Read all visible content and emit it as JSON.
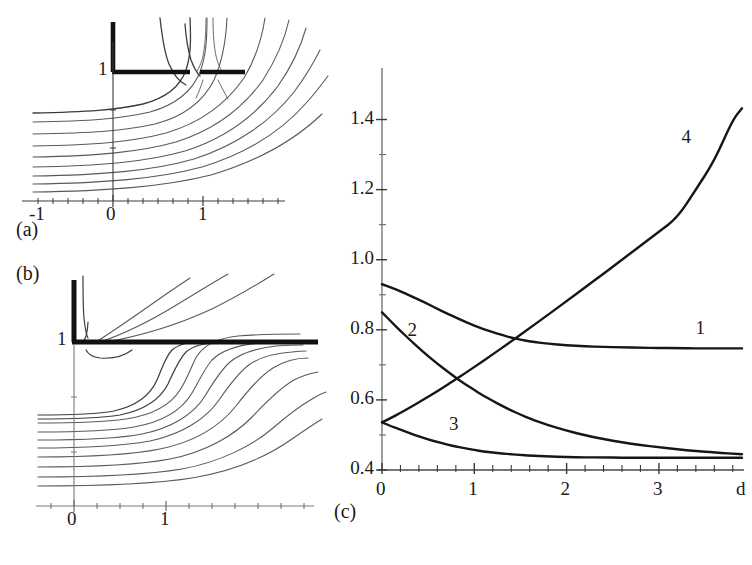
{
  "figure": {
    "type": "multi-panel-scientific-figure",
    "background_color": "#ffffff",
    "ink_color": "#1a1a1a",
    "stream_color": "#4a4a4a"
  },
  "panels": [
    {
      "id": "a",
      "label": "(a)",
      "kind": "streamline-contour-plot",
      "x_ticks": [
        "-1",
        "0",
        "1"
      ],
      "y_ticks": [
        "1"
      ],
      "obstacle": "L-shaped thick barrier plus detached horizontal plate"
    },
    {
      "id": "b",
      "label": "(b)",
      "kind": "streamline-contour-plot",
      "x_ticks": [
        "0",
        "1"
      ],
      "y_ticks": [
        "1"
      ],
      "obstacle": "L-shaped thick barrier with long horizontal wall"
    },
    {
      "id": "c",
      "label": "(c)",
      "kind": "line-chart"
    }
  ],
  "chart_data": {
    "type": "line",
    "title": "",
    "xlabel": "d",
    "ylabel": "",
    "xlim": [
      0,
      3.9
    ],
    "ylim": [
      0.4,
      1.47
    ],
    "grid": false,
    "legend": "inline-curve-numbers",
    "x_tick_labels": [
      "0",
      "1",
      "2",
      "3",
      "d"
    ],
    "x_tick_values": [
      0,
      1,
      2,
      3,
      3.9
    ],
    "x_minor_tick_step": 0.2,
    "y_tick_labels": [
      "0.4",
      "0.6",
      "0.8",
      "1.0",
      "1.2",
      "1.4"
    ],
    "y_tick_values": [
      0.4,
      0.6,
      0.8,
      1.0,
      1.2,
      1.4
    ],
    "y_minor_tick_step": 0.1,
    "series": [
      {
        "name": "1",
        "label_pos": {
          "x": 3.45,
          "y": 0.8
        },
        "x": [
          0,
          0.1,
          0.2,
          0.3,
          0.4,
          0.5,
          0.6,
          0.7,
          0.8,
          0.9,
          1.0,
          1.1,
          1.2,
          1.3,
          1.4,
          1.5,
          1.6,
          1.8,
          2.0,
          2.2,
          2.4,
          2.6,
          2.8,
          3.0,
          3.2,
          3.4,
          3.6,
          3.9
        ],
        "values": [
          0.93,
          0.921,
          0.91,
          0.898,
          0.886,
          0.873,
          0.86,
          0.847,
          0.835,
          0.823,
          0.812,
          0.802,
          0.793,
          0.785,
          0.778,
          0.772,
          0.767,
          0.76,
          0.756,
          0.753,
          0.751,
          0.75,
          0.749,
          0.748,
          0.748,
          0.747,
          0.747,
          0.747
        ]
      },
      {
        "name": "2",
        "label_pos": {
          "x": 0.33,
          "y": 0.795
        },
        "x": [
          0,
          0.1,
          0.2,
          0.3,
          0.4,
          0.5,
          0.6,
          0.7,
          0.8,
          0.9,
          1.0,
          1.1,
          1.2,
          1.3,
          1.4,
          1.5,
          1.6,
          1.8,
          2.0,
          2.2,
          2.4,
          2.6,
          2.8,
          3.0,
          3.2,
          3.4,
          3.6,
          3.9
        ],
        "values": [
          0.85,
          0.823,
          0.797,
          0.772,
          0.748,
          0.725,
          0.703,
          0.683,
          0.663,
          0.645,
          0.628,
          0.612,
          0.597,
          0.583,
          0.57,
          0.558,
          0.547,
          0.528,
          0.512,
          0.499,
          0.488,
          0.479,
          0.471,
          0.465,
          0.459,
          0.454,
          0.45,
          0.445
        ]
      },
      {
        "name": "3",
        "label_pos": {
          "x": 0.78,
          "y": 0.525
        },
        "x": [
          0,
          0.1,
          0.2,
          0.3,
          0.4,
          0.5,
          0.6,
          0.7,
          0.8,
          0.9,
          1.0,
          1.1,
          1.2,
          1.3,
          1.4,
          1.5,
          1.6,
          1.8,
          2.0,
          2.2,
          2.4,
          2.6,
          2.8,
          3.0,
          3.2,
          3.4,
          3.6,
          3.9
        ],
        "values": [
          0.536,
          0.525,
          0.515,
          0.505,
          0.496,
          0.487,
          0.48,
          0.473,
          0.467,
          0.462,
          0.457,
          0.453,
          0.45,
          0.447,
          0.445,
          0.443,
          0.441,
          0.439,
          0.437,
          0.436,
          0.436,
          0.435,
          0.435,
          0.435,
          0.435,
          0.435,
          0.435,
          0.435
        ]
      },
      {
        "name": "4",
        "label_pos": {
          "x": 3.3,
          "y": 1.345
        },
        "x": [
          0,
          0.1,
          0.2,
          0.3,
          0.4,
          0.5,
          0.6,
          0.7,
          0.8,
          0.9,
          1.0,
          1.2,
          1.4,
          1.6,
          1.8,
          2.0,
          2.2,
          2.4,
          2.6,
          2.8,
          3.0,
          3.2,
          3.4,
          3.6,
          3.8,
          3.9
        ],
        "values": [
          0.536,
          0.549,
          0.563,
          0.578,
          0.593,
          0.609,
          0.625,
          0.642,
          0.659,
          0.676,
          0.694,
          0.73,
          0.767,
          0.805,
          0.843,
          0.882,
          0.921,
          0.96,
          1.0,
          1.04,
          1.08,
          1.12,
          1.2,
          1.282,
          1.4,
          1.432
        ]
      }
    ]
  }
}
